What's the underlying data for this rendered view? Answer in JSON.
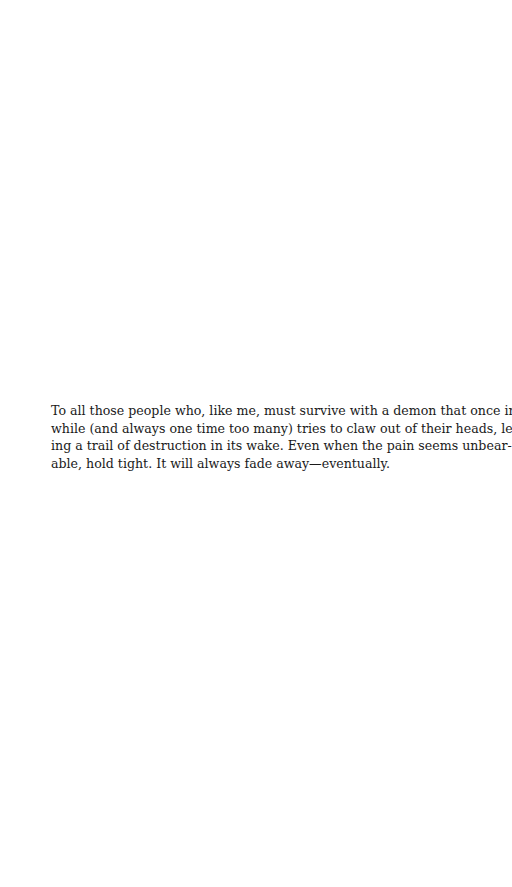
{
  "page": {
    "background": "#ffffff",
    "text_color": "#1a1a1a"
  },
  "dedication": {
    "full_text": "To all those people who, like me, must survive with a demon that once in a while (and always one time too many) tries to claw out of their heads, leaving a trail of destruction in its wake. Even when the pain seems unbearable, hold tight. It will always fade away—eventually.",
    "lines": [
      "To all those people who, like me, must survive with a demon that once in a",
      "while (and always one time too many) tries to claw out of their heads, leav-",
      "ing a trail of destruction in its wake. Even when the pain seems unbear-",
      "able, hold tight. It will always fade away—eventually."
    ]
  }
}
